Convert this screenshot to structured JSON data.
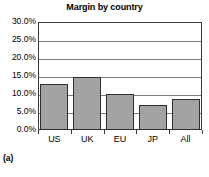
{
  "caption": "(a)",
  "chart_data": {
    "type": "bar",
    "title": "Margin by country",
    "xlabel": "",
    "ylabel": "",
    "categories": [
      "US",
      "UK",
      "EU",
      "JP",
      "All"
    ],
    "values": [
      12.7,
      14.8,
      10.0,
      6.9,
      8.6
    ],
    "ylim": [
      0.0,
      30.0
    ],
    "ytick_values": [
      30.0,
      25.0,
      20.0,
      15.0,
      10.0,
      5.0,
      0.0
    ],
    "ytick_labels": [
      "30.0%",
      "25.0%",
      "20.0%",
      "15.0%",
      "10.0%",
      "5.0%",
      "0.0%"
    ],
    "grid": true,
    "legend": false,
    "legend_position": "none",
    "bar_color": "#a3a3a3",
    "bar_border_color": "#2e2e2e",
    "grid_color": "#7d7d7d",
    "axis_color": "#3a3a3a"
  }
}
